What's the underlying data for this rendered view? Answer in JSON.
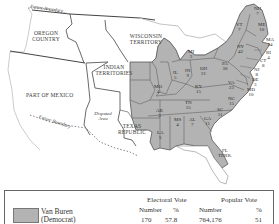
{
  "map": {
    "regions": {
      "oregon": "OREGON COUNTRY",
      "wisconsin": "WISCONSIN TERRITORY",
      "indian": "INDIAN TERRITORIES",
      "mexico": "PART OF MEXICO",
      "texas": "TEXAS REPUBLIC",
      "disputed": "Disputed Area",
      "future_boundary_north": "Future Boundary",
      "future_boundary_south": "Future Boundary",
      "florida": "FL TERR."
    },
    "states": [
      {
        "abbr": "NH",
        "ev": "7"
      },
      {
        "abbr": "VT",
        "ev": "7"
      },
      {
        "abbr": "ME",
        "ev": "10"
      },
      {
        "abbr": "MA",
        "ev": "14"
      },
      {
        "abbr": "RI",
        "ev": "4"
      },
      {
        "abbr": "CT",
        "ev": "8"
      },
      {
        "abbr": "NY",
        "ev": "42"
      },
      {
        "abbr": "PA",
        "ev": "30"
      },
      {
        "abbr": "NJ",
        "ev": "8"
      },
      {
        "abbr": "DE",
        "ev": "3"
      },
      {
        "abbr": "MD",
        "ev": "10"
      },
      {
        "abbr": "MI",
        "ev": "3"
      },
      {
        "abbr": "OH",
        "ev": "21"
      },
      {
        "abbr": "IN",
        "ev": "9"
      },
      {
        "abbr": "IL",
        "ev": "5"
      },
      {
        "abbr": "MO",
        "ev": "4"
      },
      {
        "abbr": "KY",
        "ev": "15"
      },
      {
        "abbr": "VA",
        "ev": "23"
      },
      {
        "abbr": "NC",
        "ev": "15"
      },
      {
        "abbr": "TN",
        "ev": "15"
      },
      {
        "abbr": "SC",
        "ev": "11"
      },
      {
        "abbr": "GA",
        "ev": "11"
      },
      {
        "abbr": "AL",
        "ev": "7"
      },
      {
        "abbr": "MS",
        "ev": "4"
      },
      {
        "abbr": "AR",
        "ev": "3"
      },
      {
        "abbr": "LA",
        "ev": "5"
      }
    ],
    "colors": {
      "shaded": "#b3b3b3",
      "unshaded": "#ffffff",
      "border": "#555555"
    }
  },
  "legend": {
    "electoral_header": "Electoral Vote",
    "popular_header": "Popular Vote",
    "number_label": "Number",
    "percent_label": "%",
    "candidate_name": "Van Buren",
    "candidate_party": "(Democrat)",
    "electoral_number": "170",
    "electoral_percent": "57.8",
    "popular_number": "764,176",
    "popular_percent": "51"
  }
}
